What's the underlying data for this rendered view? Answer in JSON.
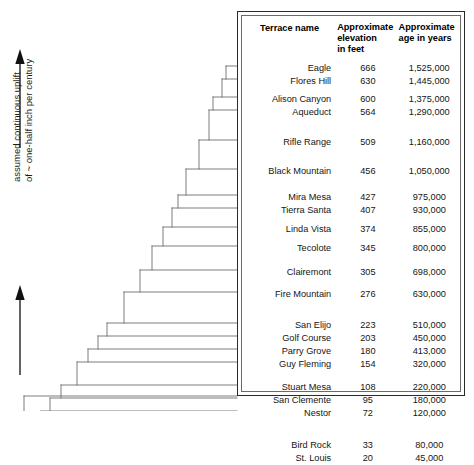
{
  "annotation": {
    "line1": "assumed continuous uplift",
    "line2": "of ~ one-half inch per century",
    "axis_icon": "double-up-arrow-icon"
  },
  "table": {
    "headers": {
      "name": "Terrace name",
      "elevation": "Approximate\nelevation\nin feet",
      "elevation_l1": "Approximate",
      "elevation_l2": "elevation",
      "elevation_l3": "in feet",
      "age_l1": "Approximate",
      "age_l2": "age in years"
    },
    "rows": [
      {
        "name": "Eagle",
        "elevation": "666",
        "age": "1,525,000"
      },
      {
        "name": "Flores Hill",
        "elevation": "630",
        "age": "1,445,000"
      },
      {
        "name": "Alison Canyon",
        "elevation": "600",
        "age": "1,375,000"
      },
      {
        "name": "Aqueduct",
        "elevation": "564",
        "age": "1,290,000"
      },
      {
        "name": "Rifle Range",
        "elevation": "509",
        "age": "1,160,000"
      },
      {
        "name": "Black Mountain",
        "elevation": "456",
        "age": "1,050,000"
      },
      {
        "name": "Mira Mesa",
        "elevation": "427",
        "age": "975,000"
      },
      {
        "name": "Tierra Santa",
        "elevation": "407",
        "age": "930,000"
      },
      {
        "name": "Linda Vista",
        "elevation": "374",
        "age": "855,000"
      },
      {
        "name": "Tecolote",
        "elevation": "345",
        "age": "800,000"
      },
      {
        "name": "Clairemont",
        "elevation": "305",
        "age": "698,000"
      },
      {
        "name": "Fire Mountain",
        "elevation": "276",
        "age": "630,000"
      },
      {
        "name": "San Elijo",
        "elevation": "223",
        "age": "510,000"
      },
      {
        "name": "Golf Course",
        "elevation": "203",
        "age": "450,000"
      },
      {
        "name": "Parry Grove",
        "elevation": "180",
        "age": "413,000"
      },
      {
        "name": "Guy Fleming",
        "elevation": "154",
        "age": "320,000"
      },
      {
        "name": "Stuart Mesa",
        "elevation": "108",
        "age": "220,000"
      },
      {
        "name": "San Clemente",
        "elevation": "95",
        "age": "180,000"
      },
      {
        "name": "Nestor",
        "elevation": "72",
        "age": "120,000"
      },
      {
        "name": "Bird Rock",
        "elevation": "33",
        "age": "80,000"
      },
      {
        "name": "St. Louis",
        "elevation": "20",
        "age": "45,000"
      }
    ]
  },
  "chart_data": {
    "type": "bar",
    "title": "",
    "xlabel": "",
    "ylabel": "assumed continuous uplift of ~ one-half inch per century",
    "orientation": "staircase-profile",
    "categories": [
      "Eagle",
      "Flores Hill",
      "Alison Canyon",
      "Aqueduct",
      "Rifle Range",
      "Black Mountain",
      "Mira Mesa",
      "Tierra Santa",
      "Linda Vista",
      "Tecolote",
      "Clairemont",
      "Fire Mountain",
      "San Elijo",
      "Golf Course",
      "Parry Grove",
      "Guy Fleming",
      "Stuart Mesa",
      "San Clemente",
      "Nestor",
      "Bird Rock",
      "St. Louis"
    ],
    "series": [
      {
        "name": "Approximate elevation in feet",
        "values": [
          666,
          630,
          600,
          564,
          509,
          456,
          427,
          407,
          374,
          345,
          305,
          276,
          223,
          203,
          180,
          154,
          108,
          95,
          72,
          33,
          20
        ]
      },
      {
        "name": "Approximate age in years",
        "values": [
          1525000,
          1445000,
          1375000,
          1290000,
          1160000,
          1050000,
          975000,
          930000,
          855000,
          800000,
          698000,
          630000,
          510000,
          450000,
          413000,
          320000,
          220000,
          180000,
          120000,
          80000,
          45000
        ]
      }
    ],
    "grid": false,
    "legend": "none"
  },
  "geometry": {
    "step_rows_y": [
      66,
      79,
      97,
      110,
      140,
      169,
      195,
      208,
      227,
      246,
      270,
      292,
      323,
      336,
      349,
      362,
      385,
      398,
      411,
      443,
      456
    ],
    "step_left_x": [
      226,
      222,
      213,
      209,
      199,
      186,
      178,
      172,
      163,
      152,
      140,
      124,
      107,
      98,
      88,
      77,
      61,
      50,
      41,
      29,
      24
    ]
  }
}
